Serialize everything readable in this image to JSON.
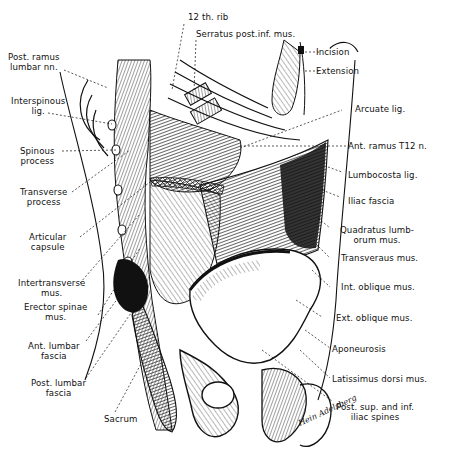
{
  "figure": {
    "signature": "Hein Adelsberg"
  },
  "labels": {
    "top": [
      {
        "id": "12th-rib",
        "text": "12 th. rib"
      },
      {
        "id": "serratus",
        "text": "Serratus post.inf. mus."
      }
    ],
    "left": [
      {
        "id": "post-ramus",
        "line1": "Post. ramus",
        "line2": "lumbar nn."
      },
      {
        "id": "interspinous",
        "line1": "Interspinous",
        "line2": "lig."
      },
      {
        "id": "spinous",
        "line1": "Spinous",
        "line2": "process"
      },
      {
        "id": "transverse-process",
        "line1": "Transverse",
        "line2": "process"
      },
      {
        "id": "articular",
        "line1": "Articular",
        "line2": "capsule"
      },
      {
        "id": "intertransverse",
        "line1": "Intertransverse",
        "line2": "mus."
      },
      {
        "id": "erector",
        "line1": "Erector spinae",
        "line2": "mus."
      },
      {
        "id": "ant-lumbar",
        "line1": "Ant. lumbar",
        "line2": "fascia"
      },
      {
        "id": "post-lumbar",
        "line1": "Post. lumbar",
        "line2": "fascia"
      },
      {
        "id": "sacrum",
        "line1": "Sacrum",
        "line2": ""
      }
    ],
    "right": [
      {
        "id": "incision",
        "line1": "Incision",
        "line2": ""
      },
      {
        "id": "extension",
        "line1": "Extension",
        "line2": ""
      },
      {
        "id": "arcuate",
        "line1": "Arcuate lig.",
        "line2": ""
      },
      {
        "id": "ant-ramus",
        "line1": "Ant. ramus T12 n.",
        "line2": ""
      },
      {
        "id": "lumbocosta",
        "line1": "Lumbocosta lig.",
        "line2": ""
      },
      {
        "id": "iliac-fascia",
        "line1": "Iliac fascia",
        "line2": ""
      },
      {
        "id": "quadratus",
        "line1": "Quadratus lumb-",
        "line2": "orum mus."
      },
      {
        "id": "transversus",
        "line1": "Transverаus mus.",
        "line2": ""
      },
      {
        "id": "int-oblique",
        "line1": "Int. oblique mus.",
        "line2": ""
      },
      {
        "id": "ext-oblique",
        "line1": "Ext. oblique mus.",
        "line2": ""
      },
      {
        "id": "aponeurosis",
        "line1": "Aponeurosis",
        "line2": ""
      },
      {
        "id": "latissimus",
        "line1": "Latissimus dorsi mus.",
        "line2": ""
      },
      {
        "id": "post-sup-inf",
        "line1": "Post. sup. and inf.",
        "line2": "iliac spines"
      }
    ]
  },
  "colors": {
    "ink": "#111111",
    "paper": "#ffffff"
  }
}
